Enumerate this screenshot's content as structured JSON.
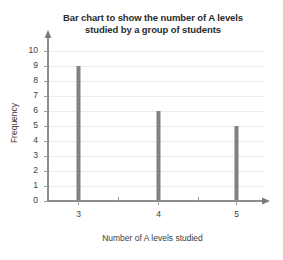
{
  "chart_data": {
    "type": "bar",
    "title": "Bar chart to show the number of A levels studied by a group of students",
    "title_line1": "Bar chart to show the number of A levels",
    "title_line2": "studied by a group of students",
    "xlabel": "Number of A levels studied",
    "ylabel": "Frequency",
    "categories": [
      "3",
      "4",
      "5"
    ],
    "values": [
      9,
      6,
      5
    ],
    "ylim": [
      0,
      10
    ],
    "ytick_labels": [
      "0",
      "1",
      "2",
      "3",
      "4",
      "5",
      "6",
      "7",
      "8",
      "9",
      "10"
    ],
    "ytick_values": [
      0,
      1,
      2,
      3,
      4,
      5,
      6,
      7,
      8,
      9,
      10
    ],
    "xtick_labels": [
      "3",
      "4",
      "5"
    ],
    "grid": true,
    "legend": "none",
    "bar_color": "#808080",
    "grid_color": "#ececec",
    "axis_color": "#8c8c8c",
    "background_color": "#ffffff"
  }
}
